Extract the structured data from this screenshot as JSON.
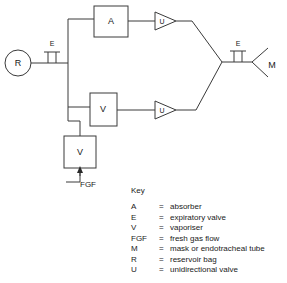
{
  "diagram": {
    "components": [
      {
        "id": "reservoir-bag",
        "symbol": "R",
        "shape": "circle",
        "x": 18,
        "y": 63
      },
      {
        "id": "expiratory-valve-left",
        "symbol": "E",
        "shape": "valve",
        "x": 51,
        "y": 63
      },
      {
        "id": "absorber",
        "symbol": "A",
        "shape": "box",
        "x": 115,
        "y": 21
      },
      {
        "id": "unidirectional-valve-upper",
        "symbol": "U",
        "shape": "triangle-right",
        "x": 165,
        "y": 21
      },
      {
        "id": "vaporiser-inline",
        "symbol": "V",
        "shape": "box",
        "x": 103,
        "y": 107
      },
      {
        "id": "unidirectional-valve-lower",
        "symbol": "U",
        "shape": "triangle-right",
        "x": 165,
        "y": 110
      },
      {
        "id": "vaporiser-fgf",
        "symbol": "V",
        "shape": "box",
        "x": 80,
        "y": 152
      },
      {
        "id": "expiratory-valve-right",
        "symbol": "E",
        "shape": "valve",
        "x": 238,
        "y": 62
      },
      {
        "id": "mask",
        "symbol": "M",
        "shape": "cone",
        "x": 268,
        "y": 62
      }
    ],
    "inlet_label": "FGF",
    "labels": {
      "absorber": "A",
      "vaporiser_inline": "V",
      "vaporiser_fgf": "V",
      "reservoir_bag": "R",
      "expiratory_valve_left": "E",
      "expiratory_valve_right": "E",
      "unidirectional_valve_upper": "U",
      "unidirectional_valve_lower": "U",
      "mask": "M"
    },
    "line_color": "#3a3a3a"
  },
  "key": {
    "title": "Key",
    "equals": "=",
    "entries": [
      {
        "symbol": "A",
        "description": "absorber"
      },
      {
        "symbol": "E",
        "description": "expiratory valve"
      },
      {
        "symbol": "V",
        "description": "vaporiser"
      },
      {
        "symbol": "FGF",
        "description": "fresh gas flow"
      },
      {
        "symbol": "M",
        "description": "mask or endotracheal tube"
      },
      {
        "symbol": "R",
        "description": "reservoir bag"
      },
      {
        "symbol": "U",
        "description": "unidirectional valve"
      }
    ]
  }
}
